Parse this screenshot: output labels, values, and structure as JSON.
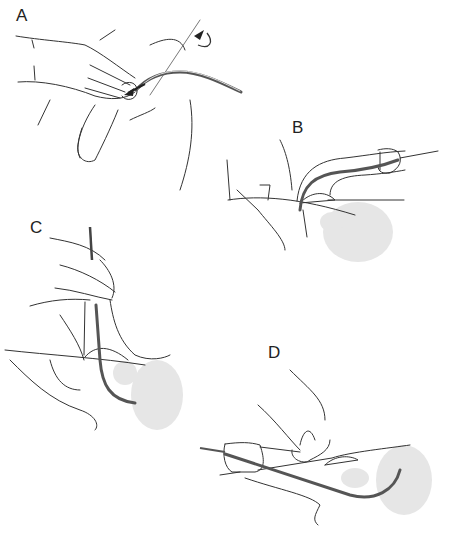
{
  "figure": {
    "panels": [
      {
        "id": "A",
        "label": "A",
        "depiction": "Hand holding penis; catheter inserted into meatus with curved arrows indicating direction of advancement"
      },
      {
        "id": "B",
        "label": "B",
        "depiction": "Side cutaway view: penis lifted, catheter advancing through urethra toward bladder"
      },
      {
        "id": "C",
        "label": "C",
        "depiction": "Penis held vertically, catheter passing through urethra into bladder (shaded)"
      },
      {
        "id": "D",
        "label": "D",
        "depiction": "Penis lowered horizontally, catheter fully advanced into bladder"
      }
    ],
    "colors": {
      "line": "#333333",
      "catheter": "#555555",
      "organ_shading": "#e6e6e6",
      "background": "#ffffff"
    }
  }
}
